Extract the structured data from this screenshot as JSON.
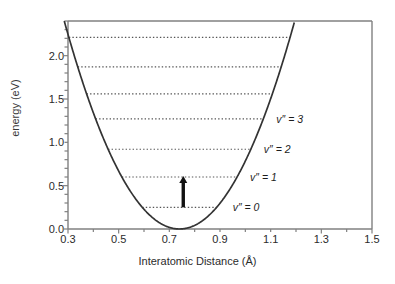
{
  "chart_data": {
    "type": "line",
    "title": "",
    "xlabel": "Interatomic Distance (Å)",
    "ylabel": "energy (eV)",
    "xlim": [
      0.3,
      1.5
    ],
    "ylim": [
      0.0,
      2.4
    ],
    "grid": false,
    "legend": "none",
    "xticks": [
      "0.3",
      "0.5",
      "0.7",
      "0.9",
      "1.1",
      "1.3",
      "1.5"
    ],
    "xtick_values": [
      0.3,
      0.5,
      0.7,
      0.9,
      1.1,
      1.3,
      1.5
    ],
    "xminor_step": 0.1,
    "yticks": [
      "0.0",
      "0.5",
      "1.0",
      "1.5",
      "2.0"
    ],
    "ytick_values": [
      0.0,
      0.5,
      1.0,
      1.5,
      2.0
    ],
    "yminor_step": 0.1,
    "curve": {
      "name": "harmonic potential well",
      "r_min": 0.74,
      "e_min": 0.0,
      "k": 11.6,
      "style": "solid",
      "color": "#333333"
    },
    "levels": [
      {
        "label": "v″ = 0",
        "energy": 0.25,
        "labelled": true
      },
      {
        "label": "v″ = 1",
        "energy": 0.6,
        "labelled": true
      },
      {
        "label": "v″ = 2",
        "energy": 0.92,
        "labelled": true
      },
      {
        "label": "v″ = 3",
        "energy": 1.27,
        "labelled": true
      },
      {
        "label": "",
        "energy": 1.56,
        "labelled": false
      },
      {
        "label": "",
        "energy": 1.87,
        "labelled": false
      },
      {
        "label": "",
        "energy": 2.21,
        "labelled": false
      }
    ],
    "annotations": [
      {
        "type": "arrow",
        "name": "vibrational-transition-arrow",
        "x": 0.755,
        "y_start": 0.25,
        "y_end": 0.6,
        "direction": "up",
        "color": "#111111"
      }
    ]
  },
  "labels": {
    "v0": "v″ = 0",
    "v1": "v″ = 1",
    "v2": "v″ = 2",
    "v3": "v″ = 3"
  }
}
